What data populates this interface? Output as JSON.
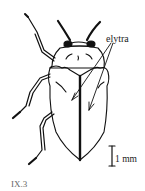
{
  "figure": {
    "labels": {
      "elytra": "elytra",
      "scale_bar": "1 mm",
      "figure_id": "IX.3"
    },
    "colors": {
      "ink": "#111111",
      "background": "#ffffff",
      "figure_id_text": "#666666"
    }
  }
}
